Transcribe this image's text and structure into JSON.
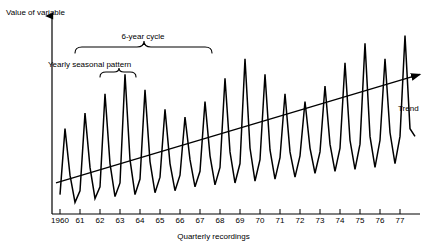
{
  "chart_data": {
    "type": "line",
    "title": "",
    "xlabel": "Quarterly recordings",
    "ylabel": "Value of variable",
    "grid": false,
    "legend": "none",
    "xtick_labels": [
      "1960",
      "61",
      "62",
      "63",
      "64",
      "65",
      "66",
      "67",
      "68",
      "69",
      "70",
      "71",
      "72",
      "73",
      "74",
      "75",
      "76",
      "77"
    ],
    "xlim": [
      1959.6,
      1978.0
    ],
    "ylim": [
      0,
      100
    ],
    "y_axis_ticks_shown": false,
    "annotations": [
      {
        "name": "6-year cycle",
        "text": "6-year cycle",
        "type": "brace",
        "span_years": [
          1960,
          1966
        ]
      },
      {
        "name": "Yearly seasonal pattern",
        "text": "Yearly seasonal pattern",
        "type": "brace",
        "span_years": [
          1961,
          1962
        ]
      },
      {
        "name": "Trend",
        "text": "Trend",
        "type": "arrow-line"
      }
    ],
    "trend_line": {
      "x": [
        1959.8,
        1978.0
      ],
      "y": [
        16,
        72
      ]
    },
    "series": [
      {
        "name": "Quarterly value",
        "description": "Sawtooth seasonal series: one sharp annual peak per year, amplitude modulated by a 6-year cycle on a rising trend",
        "x": [
          1960.0,
          1960.25,
          1960.5,
          1960.75,
          1961.0,
          1961.25,
          1961.5,
          1961.75,
          1962.0,
          1962.25,
          1962.5,
          1962.75,
          1963.0,
          1963.25,
          1963.5,
          1963.75,
          1964.0,
          1964.25,
          1964.5,
          1964.75,
          1965.0,
          1965.25,
          1965.5,
          1965.75,
          1966.0,
          1966.25,
          1966.5,
          1966.75,
          1967.0,
          1967.25,
          1967.5,
          1967.75,
          1968.0,
          1968.25,
          1968.5,
          1968.75,
          1969.0,
          1969.25,
          1969.5,
          1969.75,
          1970.0,
          1970.25,
          1970.5,
          1970.75,
          1971.0,
          1971.25,
          1971.5,
          1971.75,
          1972.0,
          1972.25,
          1972.5,
          1972.75,
          1973.0,
          1973.25,
          1973.5,
          1973.75,
          1974.0,
          1974.25,
          1974.5,
          1974.75,
          1975.0,
          1975.25,
          1975.5,
          1975.75,
          1976.0,
          1976.25,
          1976.5,
          1976.75,
          1977.0,
          1977.25,
          1977.5,
          1977.75
        ],
        "values": [
          10,
          44,
          20,
          6,
          12,
          52,
          24,
          8,
          14,
          62,
          26,
          9,
          16,
          72,
          28,
          10,
          18,
          64,
          27,
          11,
          19,
          54,
          26,
          12,
          20,
          50,
          28,
          14,
          22,
          58,
          30,
          15,
          24,
          70,
          32,
          16,
          26,
          80,
          34,
          17,
          28,
          72,
          33,
          18,
          29,
          62,
          32,
          19,
          30,
          58,
          34,
          21,
          32,
          66,
          36,
          22,
          34,
          78,
          38,
          23,
          36,
          88,
          40,
          24,
          38,
          80,
          42,
          26,
          40,
          92,
          44,
          40
        ]
      }
    ]
  }
}
